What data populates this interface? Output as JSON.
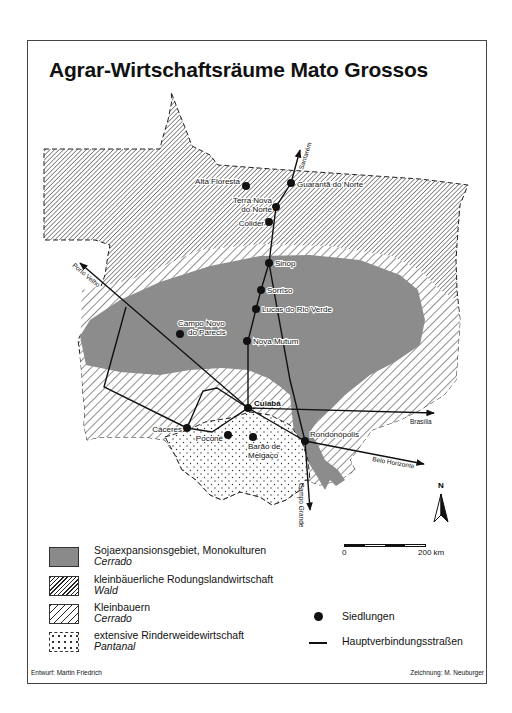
{
  "title": "Agrar-Wirtschaftsräume Mato Grossos",
  "map": {
    "settlements": [
      {
        "name": "Alta Floresta",
        "x": 246,
        "y": 186
      },
      {
        "name": "Guarantã do Norte",
        "x": 291,
        "y": 183
      },
      {
        "name": "Terra Nova do Norte",
        "x": 276,
        "y": 207
      },
      {
        "name": "Colider",
        "x": 269,
        "y": 222
      },
      {
        "name": "Sinop",
        "x": 269,
        "y": 263
      },
      {
        "name": "Sorriso",
        "x": 261,
        "y": 290
      },
      {
        "name": "Lucas do Rio Verde",
        "x": 256,
        "y": 309
      },
      {
        "name": "Campo Novo do Parecis",
        "x": 180,
        "y": 334
      },
      {
        "name": "Nova Mutum",
        "x": 247,
        "y": 341
      },
      {
        "name": "Cuiabá",
        "x": 248,
        "y": 408
      },
      {
        "name": "Cáceres",
        "x": 187,
        "y": 428
      },
      {
        "name": "Poconé",
        "x": 228,
        "y": 435
      },
      {
        "name": "Barão de Melgaço",
        "x": 253,
        "y": 437
      },
      {
        "name": "Rondonópolis",
        "x": 305,
        "y": 441
      }
    ],
    "road_destinations": {
      "north": "Santarém",
      "northwest": "Porto Velho",
      "east": "Brasília",
      "southeast": "Belo Horizonte",
      "south": "Campo Grande"
    },
    "north_arrow_label": "N"
  },
  "scale": {
    "start_label": "0",
    "end_label": "200 km"
  },
  "legend": {
    "areas": [
      {
        "label": "Sojaexpansionsgebiet, Monokulturen",
        "sub": "Cerrado",
        "pattern": "solid-gray",
        "color": "#8a8a8a"
      },
      {
        "label": "kleinbäuerliche Rodungslandwirtschaft",
        "sub": "Wald",
        "pattern": "dense-hatch"
      },
      {
        "label": "Kleinbauern",
        "sub": "Cerrado",
        "pattern": "wide-hatch"
      },
      {
        "label": "extensive Rinderweidewirtschaft",
        "sub": "Pantanal",
        "pattern": "dots"
      }
    ],
    "symbols": [
      {
        "label": "Siedlungen",
        "symbol": "dot"
      },
      {
        "label": "Hauptverbindungsstraßen",
        "symbol": "line"
      }
    ]
  },
  "credits": {
    "left": "Entwurf: Martin Friedrich",
    "right": "Zeichnung: M. Neuburger"
  }
}
